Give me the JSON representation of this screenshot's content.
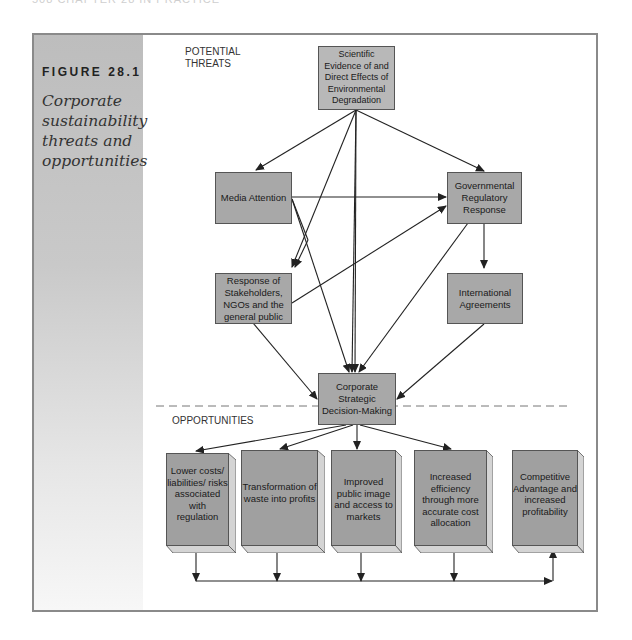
{
  "page_header": "508   CHAPTER 28  IN PRACTICE",
  "figure": {
    "label": "FIGURE 28.1",
    "caption": "Corporate sustainability threats and opportunities"
  },
  "sections": {
    "threats_label": "POTENTIAL THREATS",
    "opportunities_label": "OPPORTUNITIES"
  },
  "nodes": {
    "scientific": "Scientific Evidence of and Direct Effects of Environmental Degradation",
    "media": "Media Attention",
    "regulatory": "Governmental Regulatory Response",
    "stakeholders": "Response of Stakeholders, NGOs and the general public",
    "international": "International Agreements",
    "decision": "Corporate Strategic Decision-Making"
  },
  "opportunities": [
    "Lower costs/ liabilities/ risks associated with regulation",
    "Transformation of waste into profits",
    "Improved public image and access to markets",
    "Increased efficiency through more accurate cost allocation",
    "Competitive Advantage and increased profitability"
  ],
  "edges": [
    [
      "scientific",
      "media"
    ],
    [
      "scientific",
      "regulatory"
    ],
    [
      "scientific",
      "stakeholders"
    ],
    [
      "scientific",
      "decision"
    ],
    [
      "scientific",
      "decision"
    ],
    [
      "media",
      "regulatory"
    ],
    [
      "media",
      "stakeholders"
    ],
    [
      "media",
      "decision"
    ],
    [
      "stakeholders",
      "regulatory"
    ],
    [
      "stakeholders",
      "decision"
    ],
    [
      "regulatory",
      "international"
    ],
    [
      "regulatory",
      "decision"
    ],
    [
      "international",
      "decision"
    ],
    [
      "decision",
      "opp1"
    ],
    [
      "decision",
      "opp2"
    ],
    [
      "decision",
      "opp3"
    ],
    [
      "decision",
      "opp4"
    ],
    [
      "opp1",
      "bus"
    ],
    [
      "opp2",
      "bus"
    ],
    [
      "opp3",
      "bus"
    ],
    [
      "opp4",
      "bus"
    ],
    [
      "bus",
      "opp5"
    ]
  ],
  "colors": {
    "box_fill": "#a8a8a8",
    "box_border": "#555555",
    "arrow": "#222222",
    "side_panel": "#c4c4c4"
  }
}
